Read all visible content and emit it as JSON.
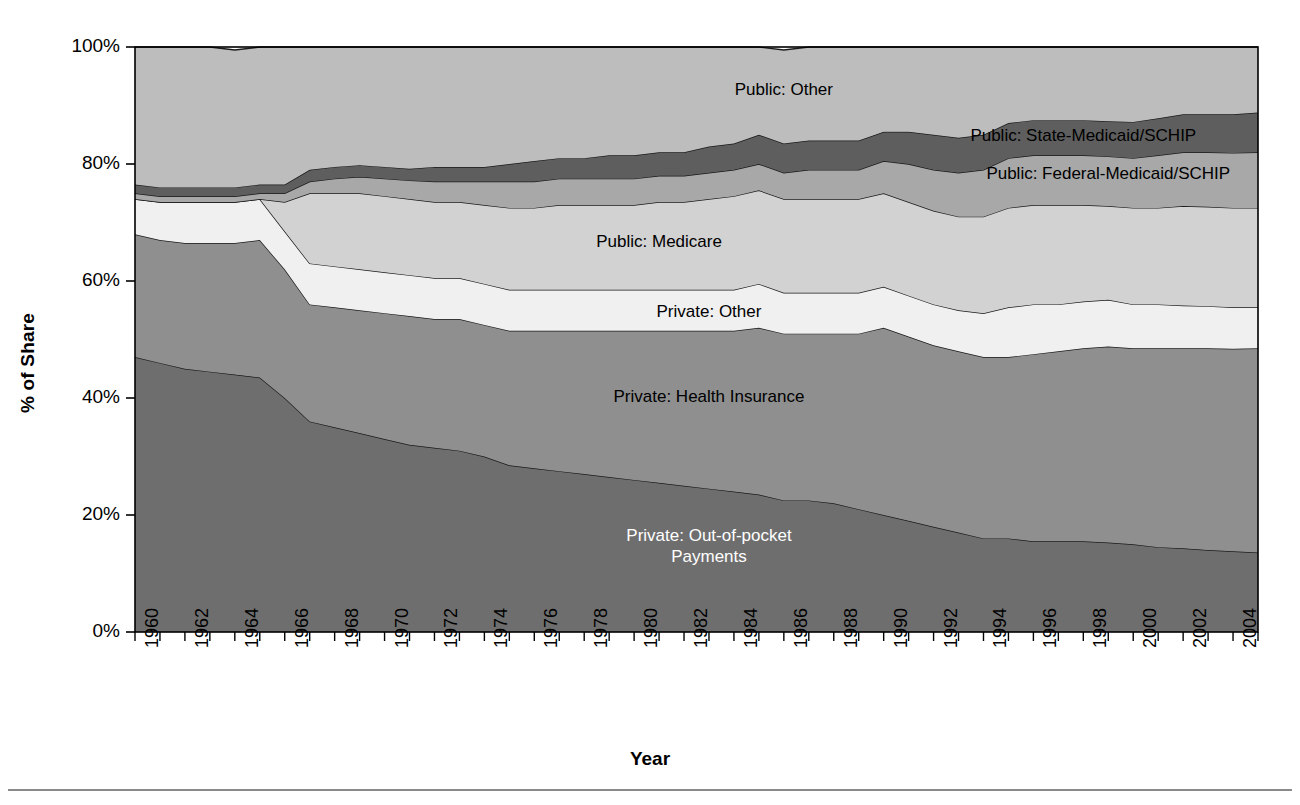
{
  "axes": {
    "ytitle": "% of Share",
    "xtitle": "Year",
    "yticks": [
      "100%",
      "80%",
      "60%",
      "40%",
      "20%",
      "0%"
    ],
    "xticks": [
      "1960",
      "1962",
      "1964",
      "1966",
      "1968",
      "1970",
      "1972",
      "1974",
      "1976",
      "1978",
      "1980",
      "1982",
      "1984",
      "1986",
      "1988",
      "1990",
      "1992",
      "1994",
      "1996",
      "1998",
      "2000",
      "2002",
      "2004"
    ]
  },
  "labels": {
    "public_other": "Public: Other",
    "public_state_medicaid": "Public: State-Medicaid/SCHIP",
    "public_federal_medicaid": "Public: Federal-Medicaid/SCHIP",
    "public_medicare": "Public: Medicare",
    "private_other": "Private: Other",
    "private_health_insurance": "Private: Health Insurance",
    "private_oop_line1": "Private: Out-of-pocket",
    "private_oop_line2": "Payments"
  },
  "colors": {
    "private_oop": "#6e6e6e",
    "private_health_insurance": "#8f8f8f",
    "private_other": "#f0f0f0",
    "public_medicare": "#d2d2d2",
    "public_federal_medicaid": "#a8a8a8",
    "public_state_medicaid": "#5e5e5e",
    "public_other": "#bdbdbd",
    "outline": "#1a1a1a",
    "axis": "#000000",
    "background": "#ffffff"
  },
  "chart_data": {
    "type": "area",
    "stacked": true,
    "title": "",
    "xlabel": "Year",
    "ylabel": "% of Share",
    "ylim": [
      0,
      100
    ],
    "xlim": [
      1960,
      2005
    ],
    "grid": false,
    "legend": "inline-band-labels",
    "x": [
      1960,
      1961,
      1962,
      1963,
      1964,
      1965,
      1966,
      1967,
      1968,
      1969,
      1970,
      1971,
      1972,
      1973,
      1974,
      1975,
      1976,
      1977,
      1978,
      1979,
      1980,
      1981,
      1982,
      1983,
      1984,
      1985,
      1986,
      1987,
      1988,
      1989,
      1990,
      1991,
      1992,
      1993,
      1994,
      1995,
      1996,
      1997,
      1998,
      1999,
      2000,
      2001,
      2002,
      2003,
      2004,
      2005
    ],
    "series": [
      {
        "name": "Private: Out-of-pocket Payments",
        "color": "#6e6e6e",
        "values": [
          47.0,
          46.0,
          45.0,
          44.5,
          44.0,
          43.5,
          40.0,
          36.0,
          35.0,
          34.0,
          33.0,
          32.0,
          31.5,
          31.0,
          30.0,
          28.5,
          28.0,
          27.5,
          27.0,
          26.5,
          26.0,
          25.5,
          25.0,
          24.5,
          24.0,
          23.5,
          22.5,
          22.5,
          22.0,
          21.0,
          20.0,
          19.0,
          18.0,
          17.0,
          16.0,
          16.0,
          15.5,
          15.5,
          15.5,
          15.3,
          15.0,
          14.5,
          14.3,
          14.0,
          13.8,
          13.6
        ]
      },
      {
        "name": "Private: Health Insurance",
        "color": "#8f8f8f",
        "values": [
          21.0,
          21.0,
          21.5,
          22.0,
          22.5,
          23.5,
          22.0,
          20.0,
          20.5,
          21.0,
          21.5,
          22.0,
          22.0,
          22.5,
          22.5,
          23.0,
          23.5,
          24.0,
          24.5,
          25.0,
          25.5,
          26.0,
          26.5,
          27.0,
          27.5,
          28.5,
          28.5,
          28.5,
          29.0,
          30.0,
          32.0,
          31.5,
          31.0,
          31.0,
          31.0,
          31.0,
          32.0,
          32.5,
          33.0,
          33.5,
          33.5,
          34.0,
          34.2,
          34.5,
          34.6,
          34.9
        ]
      },
      {
        "name": "Private: Other",
        "color": "#f0f0f0",
        "values": [
          6.0,
          6.5,
          7.0,
          7.0,
          7.0,
          7.0,
          6.5,
          7.0,
          7.0,
          7.0,
          7.0,
          7.0,
          7.0,
          7.0,
          7.0,
          7.0,
          7.0,
          7.0,
          7.0,
          7.0,
          7.0,
          7.0,
          7.0,
          7.0,
          7.0,
          7.5,
          7.0,
          7.0,
          7.0,
          7.0,
          7.0,
          7.0,
          7.0,
          7.0,
          7.5,
          8.5,
          8.5,
          8.0,
          8.0,
          8.0,
          7.5,
          7.5,
          7.3,
          7.2,
          7.1,
          7.0
        ]
      },
      {
        "name": "Public: Medicare",
        "color": "#d2d2d2",
        "values": [
          0.0,
          0.0,
          0.0,
          0.0,
          0.0,
          0.0,
          5.0,
          12.0,
          12.5,
          13.0,
          13.0,
          13.0,
          13.0,
          13.0,
          13.5,
          14.0,
          14.0,
          14.5,
          14.5,
          14.5,
          14.5,
          15.0,
          15.0,
          15.5,
          16.0,
          16.0,
          16.0,
          16.0,
          16.0,
          16.0,
          16.0,
          16.0,
          16.0,
          16.0,
          16.5,
          17.0,
          17.0,
          17.0,
          16.5,
          16.0,
          16.5,
          16.5,
          17.0,
          17.0,
          17.0,
          17.0
        ]
      },
      {
        "name": "Public: Federal-Medicaid/SCHIP",
        "color": "#a8a8a8",
        "values": [
          1.0,
          1.0,
          1.0,
          1.0,
          1.0,
          1.0,
          1.5,
          2.0,
          2.5,
          2.8,
          3.0,
          3.2,
          3.5,
          3.5,
          4.0,
          4.5,
          4.5,
          4.5,
          4.5,
          4.5,
          4.5,
          4.5,
          4.5,
          4.5,
          4.5,
          4.5,
          4.5,
          5.0,
          5.0,
          5.0,
          5.5,
          6.5,
          7.0,
          7.5,
          8.0,
          8.5,
          8.5,
          8.5,
          8.5,
          8.5,
          8.5,
          9.0,
          9.2,
          9.3,
          9.4,
          9.5
        ]
      },
      {
        "name": "Public: State-Medicaid/SCHIP",
        "color": "#5e5e5e",
        "values": [
          1.5,
          1.5,
          1.5,
          1.5,
          1.5,
          1.5,
          1.5,
          2.0,
          2.0,
          2.0,
          2.0,
          2.0,
          2.5,
          2.5,
          2.5,
          3.0,
          3.5,
          3.5,
          3.5,
          4.0,
          4.0,
          4.0,
          4.0,
          4.5,
          4.5,
          5.0,
          5.0,
          5.0,
          5.0,
          5.0,
          5.0,
          5.5,
          6.0,
          6.0,
          6.0,
          6.0,
          6.0,
          6.0,
          6.0,
          6.0,
          6.2,
          6.3,
          6.5,
          6.5,
          6.6,
          6.8
        ]
      },
      {
        "name": "Public: Other",
        "color": "#bdbdbd",
        "values": [
          23.5,
          24.0,
          24.0,
          24.0,
          23.5,
          23.5,
          23.5,
          21.0,
          20.5,
          20.2,
          20.5,
          20.8,
          20.5,
          20.5,
          20.5,
          20.0,
          19.5,
          19.0,
          19.0,
          18.5,
          18.5,
          18.0,
          18.0,
          17.0,
          16.5,
          15.0,
          16.0,
          16.0,
          16.0,
          16.0,
          14.5,
          14.5,
          15.0,
          15.5,
          15.0,
          13.0,
          12.5,
          12.5,
          12.5,
          12.7,
          12.8,
          12.2,
          11.5,
          11.5,
          11.5,
          11.2
        ]
      }
    ]
  }
}
